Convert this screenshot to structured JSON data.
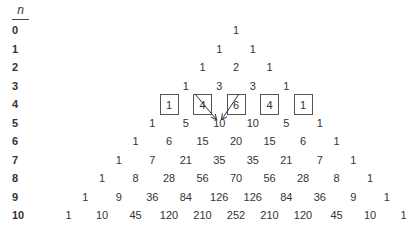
{
  "header": {
    "label": "n"
  },
  "rows": [
    {
      "n": "0",
      "values": [
        "1"
      ]
    },
    {
      "n": "1",
      "values": [
        "1",
        "1"
      ]
    },
    {
      "n": "2",
      "values": [
        "1",
        "2",
        "1"
      ]
    },
    {
      "n": "3",
      "values": [
        "1",
        "3",
        "3",
        "1"
      ]
    },
    {
      "n": "4",
      "values": [
        "1",
        "4",
        "6",
        "4",
        "1"
      ],
      "boxed": true
    },
    {
      "n": "5",
      "values": [
        "1",
        "5",
        "10",
        "10",
        "5",
        "1"
      ]
    },
    {
      "n": "6",
      "values": [
        "1",
        "6",
        "15",
        "20",
        "15",
        "6",
        "1"
      ]
    },
    {
      "n": "7",
      "values": [
        "1",
        "7",
        "21",
        "35",
        "35",
        "21",
        "7",
        "1"
      ]
    },
    {
      "n": "8",
      "values": [
        "1",
        "8",
        "28",
        "56",
        "70",
        "56",
        "28",
        "8",
        "1"
      ]
    },
    {
      "n": "9",
      "values": [
        "1",
        "9",
        "36",
        "84",
        "126",
        "126",
        "84",
        "36",
        "9",
        "1"
      ]
    },
    {
      "n": "10",
      "values": [
        "1",
        "10",
        "45",
        "120",
        "210",
        "252",
        "210",
        "120",
        "45",
        "10",
        "1"
      ]
    }
  ],
  "annotation": {
    "description": "arrows from 4 and 6 in row 4 pointing to 10 in row 5",
    "from": [
      "4",
      "6"
    ],
    "to": "10"
  }
}
